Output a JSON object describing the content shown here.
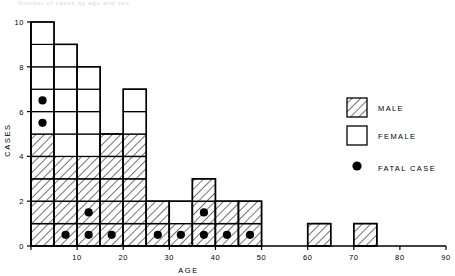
{
  "chart_data": {
    "type": "bar",
    "title": "",
    "xlabel": "AGE",
    "ylabel": "CASES",
    "xlim": [
      0,
      90
    ],
    "ylim": [
      0,
      10
    ],
    "xticks": [
      0,
      10,
      20,
      30,
      40,
      50,
      60,
      70,
      80,
      90
    ],
    "xtick_labels": [
      "",
      "10",
      "20",
      "30",
      "40",
      "50",
      "60",
      "70",
      "80",
      "90"
    ],
    "yticks": [
      0,
      2,
      4,
      6,
      8,
      10
    ],
    "ytick_labels": [
      "0",
      "2",
      "4",
      "6",
      "8",
      "10"
    ],
    "bin_width": 5,
    "grid": false,
    "legend_position": "right",
    "categories": [
      "0-5",
      "5-10",
      "10-15",
      "15-20",
      "20-25",
      "25-30",
      "30-35",
      "35-40",
      "40-45",
      "45-50",
      "50-55",
      "55-60",
      "60-65",
      "65-70",
      "70-75",
      "75-80",
      "80-85",
      "85-90"
    ],
    "bin_starts": [
      0,
      5,
      10,
      15,
      20,
      25,
      30,
      35,
      40,
      45,
      50,
      55,
      60,
      65,
      70,
      75,
      80,
      85
    ],
    "series": [
      {
        "name": "MALE",
        "values": [
          5,
          4,
          4,
          5,
          5,
          2,
          1,
          3,
          2,
          2,
          0,
          0,
          1,
          0,
          1,
          0,
          0,
          0
        ]
      },
      {
        "name": "FEMALE",
        "values": [
          5,
          5,
          4,
          0,
          2,
          0,
          1,
          0,
          0,
          0,
          0,
          0,
          0,
          0,
          0,
          0,
          0,
          0
        ]
      }
    ],
    "totals": [
      10,
      9,
      8,
      5,
      7,
      2,
      2,
      3,
      2,
      2,
      0,
      0,
      1,
      0,
      1,
      0,
      0,
      0
    ],
    "fatal_cases": [
      {
        "bin_start": 0,
        "case_index": 6
      },
      {
        "bin_start": 0,
        "case_index": 7
      },
      {
        "bin_start": 5,
        "case_index": 1
      },
      {
        "bin_start": 10,
        "case_index": 1
      },
      {
        "bin_start": 10,
        "case_index": 2
      },
      {
        "bin_start": 15,
        "case_index": 1
      },
      {
        "bin_start": 25,
        "case_index": 1
      },
      {
        "bin_start": 30,
        "case_index": 1
      },
      {
        "bin_start": 35,
        "case_index": 1
      },
      {
        "bin_start": 35,
        "case_index": 2
      },
      {
        "bin_start": 40,
        "case_index": 1
      },
      {
        "bin_start": 45,
        "case_index": 1
      }
    ],
    "annotations": []
  },
  "legend": {
    "items": [
      {
        "label": "MALE",
        "swatch": "hatched"
      },
      {
        "label": "FEMALE",
        "swatch": "empty"
      },
      {
        "label": "FATAL CASE",
        "swatch": "dot"
      }
    ]
  },
  "colors": {
    "line": "#000000",
    "fill_female": "#ffffff",
    "fill_male_hatch": "#000000",
    "dot": "#000000",
    "background": "#ffffff"
  },
  "top_fragment": {
    "text": "Number of cases by age and sex"
  }
}
